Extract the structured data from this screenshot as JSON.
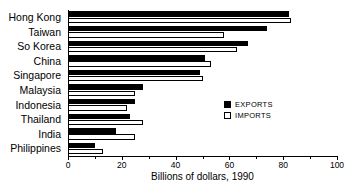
{
  "chart_data": {
    "type": "bar",
    "orientation": "horizontal",
    "title": "",
    "xlabel": "Billions of dollars, 1990",
    "ylabel": "",
    "xlim": [
      0,
      100
    ],
    "xticks": [
      0,
      20,
      40,
      60,
      80,
      100
    ],
    "xtick_labels": [
      "0",
      "20",
      "40",
      "60",
      "80",
      "100"
    ],
    "minor_tick_step": 10,
    "grid": false,
    "legend_position": "center-right",
    "categories": [
      "Hong Kong",
      "Taiwan",
      "So Korea",
      "China",
      "Singapore",
      "Malaysia",
      "Indonesia",
      "Thailand",
      "India",
      "Philippines"
    ],
    "series": [
      {
        "name": "EXPORTS",
        "color": "#000000",
        "values": [
          82,
          74,
          67,
          51,
          49,
          28,
          25,
          23,
          18,
          10
        ]
      },
      {
        "name": "IMPORTS",
        "color": "#ffffff",
        "values": [
          83,
          58,
          63,
          53,
          50,
          25,
          22,
          28,
          25,
          13
        ]
      }
    ]
  },
  "legend": {
    "items": [
      {
        "label": "EXPORTS",
        "swatch": "filled-black-square"
      },
      {
        "label": "IMPORTS",
        "swatch": "outlined-white-square"
      }
    ]
  },
  "colors": {
    "exports": "#000000",
    "imports": "#ffffff",
    "axis": "#000000",
    "background": "#ffffff"
  }
}
